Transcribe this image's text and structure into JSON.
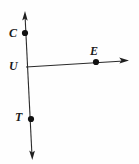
{
  "figure": {
    "type": "geometry-diagram",
    "background_color": "#fefefe",
    "stroke_color": "#2b2b2b",
    "label_color": "#1a1a1a",
    "points": [
      {
        "id": "C",
        "label": "C",
        "x": 25,
        "y": 33,
        "label_x": 9,
        "label_y": 27
      },
      {
        "id": "U",
        "label": "U",
        "x": 26,
        "y": 67,
        "label_x": 9,
        "label_y": 60
      },
      {
        "id": "T",
        "label": "T",
        "x": 31,
        "y": 119,
        "label_x": 15,
        "label_y": 111
      },
      {
        "id": "E",
        "label": "E",
        "x": 96,
        "y": 62,
        "label_x": 90,
        "label_y": 45
      }
    ],
    "lines": [
      {
        "id": "vertical-line-CUT",
        "through": [
          "C",
          "U",
          "T"
        ],
        "x1": 25,
        "y1": 15,
        "x2": 32,
        "y2": 156,
        "arrow_start": true,
        "arrow_end": true
      },
      {
        "id": "horizontal-ray-UE",
        "through": [
          "U",
          "E"
        ],
        "x1": 26,
        "y1": 67,
        "x2": 126,
        "y2": 61,
        "arrow_start": false,
        "arrow_end": true
      }
    ]
  }
}
